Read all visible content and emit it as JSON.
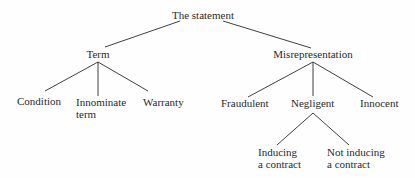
{
  "diagram": {
    "type": "tree",
    "root": {
      "label": "The statement",
      "children": [
        {
          "label": "Term",
          "children": [
            {
              "label": "Condition"
            },
            {
              "label": "Innominate term",
              "lines": [
                "Innominate",
                "term"
              ]
            },
            {
              "label": "Warranty"
            }
          ]
        },
        {
          "label": "Misrepresentation",
          "children": [
            {
              "label": "Fraudulent"
            },
            {
              "label": "Negligent",
              "children": [
                {
                  "label": "Inducing a contract",
                  "lines": [
                    "Inducing",
                    "a contract"
                  ]
                },
                {
                  "label": "Not inducing a contract",
                  "lines": [
                    "Not inducing",
                    "a contract"
                  ]
                }
              ]
            },
            {
              "label": "Innocent"
            }
          ]
        }
      ]
    }
  },
  "labels": {
    "root": "The statement",
    "term": "Term",
    "misrep": "Misrepresentation",
    "condition": "Condition",
    "innominate_1": "Innominate",
    "innominate_2": "term",
    "warranty": "Warranty",
    "fraudulent": "Fraudulent",
    "negligent": "Negligent",
    "innocent": "Innocent",
    "inducing_1": "Inducing",
    "inducing_2": "a contract",
    "not_inducing_1": "Not inducing",
    "not_inducing_2": "a contract"
  },
  "colors": {
    "line": "#2a2a2a",
    "text": "#2a2a2a",
    "background": "#fefefe"
  }
}
